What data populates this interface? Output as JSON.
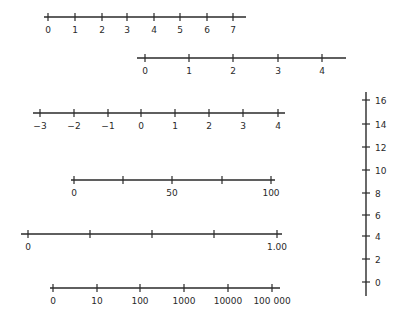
{
  "diagram": {
    "title": "",
    "stroke_color": "#2a2a2a",
    "number_lines": [
      {
        "id": "line-0-to-7",
        "orientation": "horizontal",
        "y": 17,
        "x_start": 44,
        "x_end": 246,
        "ticks": [
          {
            "x": 48,
            "label": "0"
          },
          {
            "x": 75,
            "label": "1"
          },
          {
            "x": 102,
            "label": "2"
          },
          {
            "x": 127,
            "label": "3"
          },
          {
            "x": 154,
            "label": "4"
          },
          {
            "x": 180,
            "label": "5"
          },
          {
            "x": 207,
            "label": "6"
          },
          {
            "x": 233,
            "label": "7"
          }
        ]
      },
      {
        "id": "line-0-to-4",
        "orientation": "horizontal",
        "y": 58,
        "x_start": 137,
        "x_end": 346,
        "ticks": [
          {
            "x": 145,
            "label": "0"
          },
          {
            "x": 189,
            "label": "1"
          },
          {
            "x": 233,
            "label": "2"
          },
          {
            "x": 278,
            "label": "3"
          },
          {
            "x": 322,
            "label": "4"
          }
        ]
      },
      {
        "id": "line-neg3-to-4",
        "orientation": "horizontal",
        "y": 113,
        "x_start": 33,
        "x_end": 285,
        "ticks": [
          {
            "x": 40,
            "label": "−3"
          },
          {
            "x": 74,
            "label": "−2"
          },
          {
            "x": 108,
            "label": "−1"
          },
          {
            "x": 141,
            "label": "0"
          },
          {
            "x": 175,
            "label": "1"
          },
          {
            "x": 209,
            "label": "2"
          },
          {
            "x": 243,
            "label": "3"
          },
          {
            "x": 278,
            "label": "4"
          }
        ]
      },
      {
        "id": "line-0-to-100",
        "orientation": "horizontal",
        "y": 180,
        "x_start": 71,
        "x_end": 275,
        "ticks": [
          {
            "x": 74,
            "label": "0"
          },
          {
            "x": 123,
            "label": ""
          },
          {
            "x": 172,
            "label": "50"
          },
          {
            "x": 222,
            "label": ""
          },
          {
            "x": 271,
            "label": "100"
          }
        ]
      },
      {
        "id": "line-0-to-1",
        "orientation": "horizontal",
        "y": 234,
        "x_start": 21,
        "x_end": 282,
        "ticks": [
          {
            "x": 28,
            "label": "0"
          },
          {
            "x": 90,
            "label": ""
          },
          {
            "x": 152,
            "label": ""
          },
          {
            "x": 214,
            "label": ""
          },
          {
            "x": 277,
            "label": "1.00"
          }
        ]
      },
      {
        "id": "line-log-scale",
        "orientation": "horizontal",
        "y": 288,
        "x_start": 50,
        "x_end": 280,
        "ticks": [
          {
            "x": 53,
            "label": "0"
          },
          {
            "x": 97,
            "label": "10"
          },
          {
            "x": 140,
            "label": "100"
          },
          {
            "x": 184,
            "label": "1000"
          },
          {
            "x": 228,
            "label": "10000"
          },
          {
            "x": 272,
            "label": "100 000"
          }
        ]
      },
      {
        "id": "line-vertical-0-to-16",
        "orientation": "vertical",
        "x": 366,
        "y_start": 92,
        "y_end": 296,
        "ticks": [
          {
            "y": 100,
            "label": "16"
          },
          {
            "y": 124,
            "label": "14"
          },
          {
            "y": 147,
            "label": "12"
          },
          {
            "y": 170,
            "label": "10"
          },
          {
            "y": 193,
            "label": "8"
          },
          {
            "y": 215,
            "label": "6"
          },
          {
            "y": 236,
            "label": "4"
          },
          {
            "y": 259,
            "label": "2"
          },
          {
            "y": 282,
            "label": "0"
          }
        ]
      }
    ]
  }
}
